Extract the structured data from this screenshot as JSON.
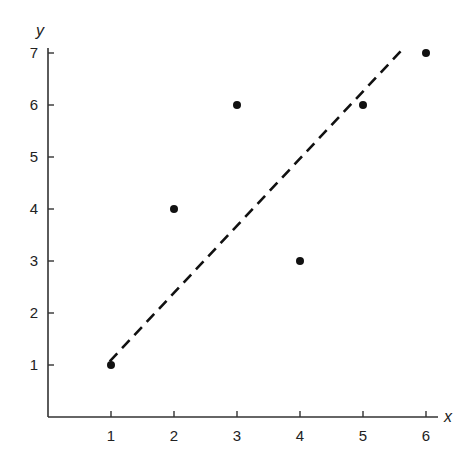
{
  "chart_data": {
    "type": "scatter",
    "title": "",
    "xlabel": "x",
    "ylabel": "y",
    "xlim": [
      0,
      6.2
    ],
    "ylim": [
      0,
      7.2
    ],
    "grid": false,
    "legend": null,
    "x_ticks": [
      1,
      2,
      3,
      4,
      5,
      6
    ],
    "y_ticks": [
      1,
      2,
      3,
      4,
      5,
      6,
      7
    ],
    "series": [
      {
        "name": "data points",
        "style": "filled-circle",
        "color": "#111111",
        "points": [
          {
            "x": 1,
            "y": 1
          },
          {
            "x": 2,
            "y": 4
          },
          {
            "x": 3,
            "y": 6
          },
          {
            "x": 4,
            "y": 3
          },
          {
            "x": 5,
            "y": 6
          },
          {
            "x": 6,
            "y": 7
          }
        ]
      },
      {
        "name": "fitted line",
        "style": "dashed-line",
        "color": "#111111",
        "start": {
          "x": 0.98,
          "y": 1.07
        },
        "end": {
          "x": 5.65,
          "y": 7.1
        }
      }
    ]
  },
  "layout": {
    "origin_px": [
      48,
      417
    ],
    "x_unit_px": 63,
    "y_unit_px": 52,
    "x_axis_end_px": 438,
    "y_axis_top_px": 48
  }
}
